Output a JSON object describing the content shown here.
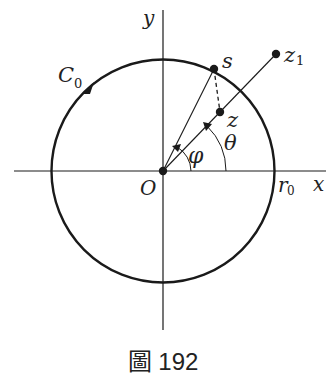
{
  "figure": {
    "caption": "圖 192",
    "labels": {
      "y_axis": "y",
      "x_axis": "x",
      "origin": "O",
      "curve_main": "C",
      "curve_sub": "0",
      "radius_main": "r",
      "radius_sub": "0",
      "point_s": "s",
      "point_z": "z",
      "point_z1_main": "z",
      "point_z1_sub": "1",
      "angle_phi": "φ",
      "angle_theta": "θ"
    },
    "colors": {
      "ink": "#1a1a1a",
      "background": "#ffffff"
    }
  }
}
